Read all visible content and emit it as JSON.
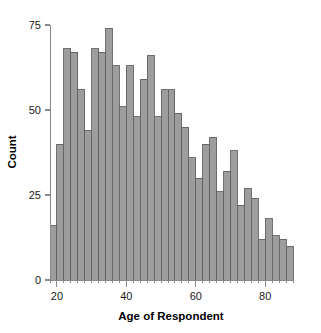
{
  "chart_data": {
    "type": "bar",
    "title": "",
    "xlabel": "Age of Respondent",
    "ylabel": "Count",
    "xlim": [
      17,
      89
    ],
    "ylim": [
      0,
      77
    ],
    "grid": false,
    "legend": null,
    "bin_width": 2,
    "x_ticks": [
      20,
      40,
      60,
      80
    ],
    "x_tick_labels": [
      "20",
      "40",
      "60",
      "80"
    ],
    "y_ticks": [
      0,
      25,
      50,
      75
    ],
    "y_tick_labels": [
      "0",
      "25",
      "50",
      "75"
    ],
    "bar_color": "#9d9d9d",
    "bar_edge_color": "#636363",
    "axis_color": "#8a8a8a",
    "bin_starts": [
      18,
      20,
      22,
      24,
      26,
      28,
      30,
      32,
      34,
      36,
      38,
      40,
      42,
      44,
      46,
      48,
      50,
      52,
      54,
      56,
      58,
      60,
      62,
      64,
      66,
      68,
      70,
      72,
      74,
      76,
      78,
      80,
      82,
      84,
      86
    ],
    "bin_ends": [
      20,
      22,
      24,
      26,
      28,
      30,
      32,
      34,
      36,
      38,
      40,
      42,
      44,
      46,
      48,
      50,
      52,
      54,
      56,
      58,
      60,
      62,
      64,
      66,
      68,
      70,
      72,
      74,
      76,
      78,
      80,
      82,
      84,
      86,
      88
    ],
    "categories": [
      "18-20",
      "20-22",
      "22-24",
      "24-26",
      "26-28",
      "28-30",
      "30-32",
      "32-34",
      "34-36",
      "36-38",
      "38-40",
      "40-42",
      "42-44",
      "44-46",
      "46-48",
      "48-50",
      "50-52",
      "52-54",
      "54-56",
      "56-58",
      "58-60",
      "60-62",
      "62-64",
      "64-66",
      "66-68",
      "68-70",
      "70-72",
      "72-74",
      "74-76",
      "76-78",
      "78-80",
      "80-82",
      "82-84",
      "84-86",
      "86-88"
    ],
    "values": [
      16,
      40,
      68,
      67,
      56,
      44,
      68,
      67,
      74,
      63,
      51,
      63,
      48,
      59,
      66,
      48,
      56,
      56,
      49,
      45,
      36,
      30,
      40,
      42,
      26,
      32,
      38,
      22,
      27,
      24,
      12,
      18,
      13,
      12,
      10
    ]
  }
}
